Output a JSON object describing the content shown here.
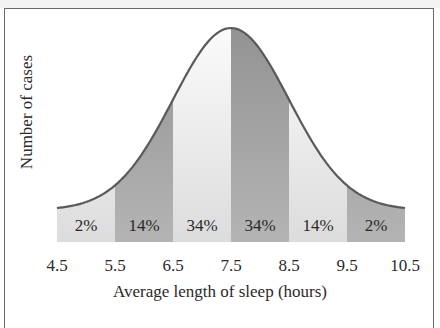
{
  "chart_data": {
    "type": "area",
    "title": "",
    "xlabel": "Average length of sleep (hours)",
    "ylabel": "Number of cases",
    "x_ticks": [
      "4.5",
      "5.5",
      "6.5",
      "7.5",
      "8.5",
      "9.5",
      "10.5"
    ],
    "xlim": [
      4.5,
      10.5
    ],
    "distribution": "normal",
    "mean": 7.5,
    "sd": 1.0,
    "bands": [
      {
        "range": [
          4.5,
          5.5
        ],
        "label": "2%",
        "value": 2,
        "shade": "light"
      },
      {
        "range": [
          5.5,
          6.5
        ],
        "label": "14%",
        "value": 14,
        "shade": "dark"
      },
      {
        "range": [
          6.5,
          7.5
        ],
        "label": "34%",
        "value": 34,
        "shade": "light"
      },
      {
        "range": [
          7.5,
          8.5
        ],
        "label": "34%",
        "value": 34,
        "shade": "dark"
      },
      {
        "range": [
          8.5,
          9.5
        ],
        "label": "14%",
        "value": 14,
        "shade": "light"
      },
      {
        "range": [
          9.5,
          10.5
        ],
        "label": "2%",
        "value": 2,
        "shade": "dark"
      }
    ],
    "grid": false,
    "legend": null
  },
  "colors": {
    "curve": "#5a5a5a",
    "dark_band": "#a9a9a9",
    "light_band": "#e4e4e4",
    "frame": "#6a6a6a",
    "text": "#2a2a2a"
  }
}
